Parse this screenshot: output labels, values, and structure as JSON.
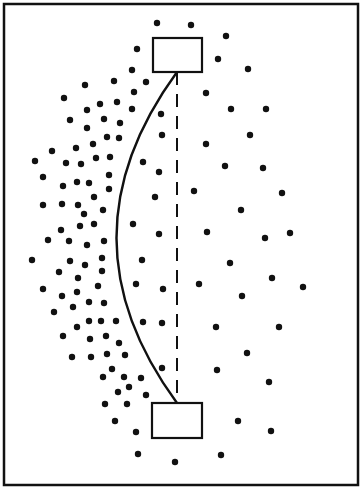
{
  "canvas": {
    "width": 362,
    "height": 491,
    "background": "#ffffff",
    "ink": "#111111"
  },
  "frame": {
    "x": 4,
    "y": 4,
    "width": 354,
    "height": 481,
    "stroke_width": 2.5
  },
  "top_box": {
    "x": 153,
    "y": 38,
    "width": 49,
    "height": 34
  },
  "bottom_box": {
    "x": 152,
    "y": 403,
    "width": 50,
    "height": 35
  },
  "dashed_line": {
    "x": 177,
    "y1": 72,
    "y2": 403,
    "dash": "13 9"
  },
  "curve": {
    "start": [
      177,
      72
    ],
    "control": [
      56,
      238
    ],
    "end": [
      177,
      403
    ]
  },
  "dot_radius": 3.2,
  "dots": [
    [
      157,
      23
    ],
    [
      191,
      25
    ],
    [
      226,
      36
    ],
    [
      137,
      49
    ],
    [
      218,
      59
    ],
    [
      132,
      70
    ],
    [
      248,
      69
    ],
    [
      85,
      85
    ],
    [
      114,
      81
    ],
    [
      146,
      82
    ],
    [
      134,
      92
    ],
    [
      206,
      93
    ],
    [
      64,
      98
    ],
    [
      100,
      104
    ],
    [
      117,
      102
    ],
    [
      87,
      110
    ],
    [
      132,
      109
    ],
    [
      231,
      109
    ],
    [
      266,
      109
    ],
    [
      161,
      114
    ],
    [
      70,
      120
    ],
    [
      104,
      119
    ],
    [
      120,
      123
    ],
    [
      87,
      128
    ],
    [
      162,
      135
    ],
    [
      250,
      135
    ],
    [
      107,
      137
    ],
    [
      119,
      138
    ],
    [
      93,
      144
    ],
    [
      206,
      144
    ],
    [
      52,
      151
    ],
    [
      76,
      148
    ],
    [
      35,
      161
    ],
    [
      66,
      163
    ],
    [
      81,
      164
    ],
    [
      96,
      158
    ],
    [
      110,
      157
    ],
    [
      143,
      162
    ],
    [
      225,
      166
    ],
    [
      263,
      168
    ],
    [
      159,
      172
    ],
    [
      43,
      177
    ],
    [
      63,
      186
    ],
    [
      77,
      182
    ],
    [
      89,
      183
    ],
    [
      109,
      175
    ],
    [
      109,
      189
    ],
    [
      194,
      191
    ],
    [
      282,
      193
    ],
    [
      94,
      197
    ],
    [
      155,
      197
    ],
    [
      43,
      205
    ],
    [
      62,
      204
    ],
    [
      78,
      205
    ],
    [
      84,
      214
    ],
    [
      103,
      210
    ],
    [
      241,
      210
    ],
    [
      80,
      226
    ],
    [
      94,
      224
    ],
    [
      133,
      224
    ],
    [
      61,
      230
    ],
    [
      159,
      234
    ],
    [
      207,
      232
    ],
    [
      265,
      238
    ],
    [
      290,
      233
    ],
    [
      48,
      240
    ],
    [
      69,
      241
    ],
    [
      87,
      245
    ],
    [
      104,
      241
    ],
    [
      32,
      260
    ],
    [
      70,
      261
    ],
    [
      85,
      265
    ],
    [
      102,
      258
    ],
    [
      142,
      260
    ],
    [
      230,
      263
    ],
    [
      59,
      272
    ],
    [
      102,
      271
    ],
    [
      78,
      278
    ],
    [
      272,
      278
    ],
    [
      43,
      289
    ],
    [
      98,
      286
    ],
    [
      136,
      284
    ],
    [
      163,
      289
    ],
    [
      199,
      284
    ],
    [
      303,
      287
    ],
    [
      62,
      296
    ],
    [
      77,
      292
    ],
    [
      242,
      296
    ],
    [
      89,
      302
    ],
    [
      104,
      303
    ],
    [
      73,
      307
    ],
    [
      54,
      312
    ],
    [
      89,
      321
    ],
    [
      101,
      321
    ],
    [
      116,
      321
    ],
    [
      143,
      322
    ],
    [
      162,
      323
    ],
    [
      77,
      327
    ],
    [
      216,
      327
    ],
    [
      279,
      327
    ],
    [
      63,
      336
    ],
    [
      90,
      339
    ],
    [
      106,
      336
    ],
    [
      119,
      343
    ],
    [
      72,
      357
    ],
    [
      91,
      357
    ],
    [
      107,
      354
    ],
    [
      125,
      355
    ],
    [
      247,
      353
    ],
    [
      162,
      368
    ],
    [
      217,
      370
    ],
    [
      112,
      369
    ],
    [
      103,
      377
    ],
    [
      124,
      377
    ],
    [
      141,
      378
    ],
    [
      269,
      382
    ],
    [
      129,
      387
    ],
    [
      118,
      392
    ],
    [
      146,
      395
    ],
    [
      105,
      404
    ],
    [
      127,
      404
    ],
    [
      115,
      421
    ],
    [
      238,
      421
    ],
    [
      136,
      432
    ],
    [
      271,
      431
    ],
    [
      138,
      454
    ],
    [
      175,
      462
    ],
    [
      221,
      455
    ]
  ]
}
